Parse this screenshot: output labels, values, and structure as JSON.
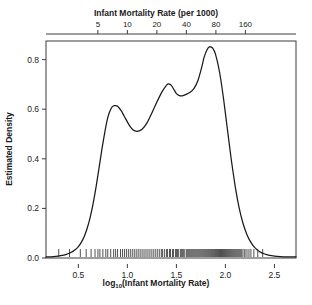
{
  "chart_data": {
    "type": "line",
    "title": "",
    "xlabel": "log10(Infant Mortality Rate)",
    "xlabel_base": "log",
    "xlabel_sub": "10",
    "xlabel_rest": "(Infant Mortality Rate)",
    "ylabel": "Estimated Density",
    "top_axis_label": "Infant Mortality Rate (per 1000)",
    "xlim": [
      0.17,
      2.72
    ],
    "ylim": [
      0.0,
      0.875
    ],
    "grid": false,
    "legend": null,
    "xticks": [
      0.5,
      1.0,
      1.5,
      2.0,
      2.5
    ],
    "xticklabels": [
      "0.5",
      "1.0",
      "1.5",
      "2.0",
      "2.5"
    ],
    "yticks": [
      0.0,
      0.2,
      0.4,
      0.6,
      0.8
    ],
    "yticklabels": [
      "0.0",
      "0.2",
      "0.4",
      "0.6",
      "0.8"
    ],
    "top_ticks": [
      5,
      10,
      20,
      40,
      80,
      160
    ],
    "top_ticklabels": [
      "5",
      "10",
      "20",
      "40",
      "80",
      "160"
    ],
    "top_tick_positions_log10": [
      0.699,
      1.0,
      1.301,
      1.602,
      1.903,
      2.204
    ],
    "series": [
      {
        "name": "Estimated Density",
        "color": "#1a1a1a",
        "x": [
          0.17,
          0.22,
          0.27,
          0.32,
          0.37,
          0.42,
          0.47,
          0.5,
          0.53,
          0.56,
          0.59,
          0.62,
          0.65,
          0.68,
          0.71,
          0.74,
          0.77,
          0.8,
          0.83,
          0.86,
          0.9,
          0.94,
          0.98,
          1.02,
          1.06,
          1.1,
          1.15,
          1.2,
          1.25,
          1.3,
          1.35,
          1.4,
          1.42,
          1.45,
          1.48,
          1.5,
          1.53,
          1.56,
          1.6,
          1.64,
          1.68,
          1.72,
          1.76,
          1.78,
          1.81,
          1.84,
          1.87,
          1.9,
          1.94,
          1.98,
          2.02,
          2.06,
          2.1,
          2.14,
          2.18,
          2.22,
          2.26,
          2.3,
          2.35,
          2.4,
          2.45,
          2.5,
          2.56,
          2.62,
          2.68,
          2.72
        ],
        "y": [
          0.004,
          0.005,
          0.007,
          0.01,
          0.014,
          0.021,
          0.034,
          0.046,
          0.063,
          0.087,
          0.12,
          0.163,
          0.218,
          0.285,
          0.36,
          0.438,
          0.508,
          0.566,
          0.6,
          0.614,
          0.612,
          0.592,
          0.563,
          0.535,
          0.516,
          0.511,
          0.519,
          0.545,
          0.585,
          0.628,
          0.668,
          0.697,
          0.702,
          0.695,
          0.676,
          0.663,
          0.655,
          0.654,
          0.66,
          0.668,
          0.684,
          0.716,
          0.772,
          0.806,
          0.838,
          0.852,
          0.846,
          0.82,
          0.75,
          0.645,
          0.52,
          0.396,
          0.288,
          0.202,
          0.139,
          0.094,
          0.063,
          0.042,
          0.025,
          0.016,
          0.011,
          0.008,
          0.006,
          0.005,
          0.005,
          0.005
        ]
      }
    ],
    "rug": {
      "name": "rug-plot",
      "values": [
        0.3,
        0.41,
        0.52,
        0.58,
        0.63,
        0.67,
        0.7,
        0.72,
        0.75,
        0.78,
        0.8,
        0.83,
        0.86,
        0.88,
        0.9,
        0.93,
        0.95,
        0.97,
        0.99,
        1.01,
        1.03,
        1.05,
        1.07,
        1.09,
        1.11,
        1.13,
        1.15,
        1.17,
        1.19,
        1.21,
        1.23,
        1.25,
        1.27,
        1.29,
        1.31,
        1.33,
        1.35,
        1.36,
        1.38,
        1.4,
        1.41,
        1.43,
        1.44,
        1.46,
        1.47,
        1.49,
        1.5,
        1.51,
        1.52,
        1.54,
        1.55,
        1.56,
        1.57,
        1.58,
        1.6,
        1.61,
        1.62,
        1.63,
        1.64,
        1.65,
        1.66,
        1.67,
        1.68,
        1.69,
        1.7,
        1.71,
        1.72,
        1.73,
        1.74,
        1.75,
        1.76,
        1.77,
        1.78,
        1.79,
        1.8,
        1.81,
        1.82,
        1.83,
        1.84,
        1.85,
        1.86,
        1.87,
        1.88,
        1.89,
        1.9,
        1.91,
        1.92,
        1.93,
        1.94,
        1.95,
        1.96,
        1.97,
        1.98,
        1.99,
        2.0,
        2.01,
        2.02,
        2.03,
        2.04,
        2.05,
        2.06,
        2.07,
        2.08,
        2.09,
        2.1,
        2.11,
        2.12,
        2.13,
        2.14,
        2.15,
        2.16,
        2.17,
        2.19,
        2.2,
        2.22,
        2.24,
        2.26,
        2.29,
        2.33,
        2.38
      ]
    }
  },
  "style": {
    "axis_color": "#3c3c3c",
    "curve_color": "#1a1a1a",
    "rug_color": "#3c3c3c",
    "background": "#ffffff"
  }
}
